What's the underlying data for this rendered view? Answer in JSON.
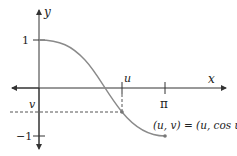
{
  "diagram": {
    "axes": {
      "x_label": "x",
      "y_label": "y"
    },
    "ticks": {
      "y_one": "1",
      "y_minus_one": "−1",
      "x_pi": "π",
      "x_u": "u",
      "y_v": "v"
    },
    "annotation": "(u, v) = (u, cos u)",
    "curve": {
      "function": "cos x",
      "domain": [
        0,
        3.14159
      ],
      "color": "#8a8a8a"
    },
    "colors": {
      "axis": "#333333",
      "dashed": "#555555"
    }
  }
}
